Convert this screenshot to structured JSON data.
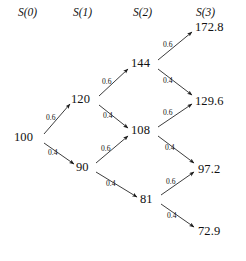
{
  "diagram": {
    "headers": [
      {
        "label": "S(0)",
        "x": 18,
        "y": 6
      },
      {
        "label": "S(1)",
        "x": 73,
        "y": 6
      },
      {
        "label": "S(2)",
        "x": 133,
        "y": 6
      },
      {
        "label": "S(3)",
        "x": 196,
        "y": 6
      }
    ],
    "nodes": [
      {
        "id": "n0",
        "label": "100",
        "x": 14,
        "y": 130,
        "step": 0
      },
      {
        "id": "n1u",
        "label": "120",
        "x": 71,
        "y": 92,
        "step": 1
      },
      {
        "id": "n1d",
        "label": "90",
        "x": 76,
        "y": 160,
        "step": 1
      },
      {
        "id": "n2uu",
        "label": "144",
        "x": 131,
        "y": 56,
        "step": 2
      },
      {
        "id": "n2ud",
        "label": "108",
        "x": 131,
        "y": 123,
        "step": 2
      },
      {
        "id": "n2dd",
        "label": "81",
        "x": 140,
        "y": 192,
        "step": 2
      },
      {
        "id": "n3a",
        "label": "172.8",
        "x": 195,
        "y": 20,
        "step": 3
      },
      {
        "id": "n3b",
        "label": "129.6",
        "x": 195,
        "y": 94,
        "step": 3
      },
      {
        "id": "n3c",
        "label": "97.2",
        "x": 198,
        "y": 162,
        "step": 3
      },
      {
        "id": "n3d",
        "label": "72.9",
        "x": 198,
        "y": 224,
        "step": 3
      }
    ],
    "edges": [
      {
        "from": "n0",
        "to": "n1u",
        "prob": "0.6",
        "direction": "up",
        "x1": 44,
        "y1": 134,
        "x2": 70,
        "y2": 104,
        "lx": 46,
        "ly": 113
      },
      {
        "from": "n0",
        "to": "n1d",
        "prob": "0.4",
        "direction": "down",
        "x1": 44,
        "y1": 143,
        "x2": 74,
        "y2": 164,
        "lx": 48,
        "ly": 148
      },
      {
        "from": "n1u",
        "to": "n2uu",
        "prob": "0.6",
        "direction": "up",
        "x1": 99,
        "y1": 96,
        "x2": 128,
        "y2": 69,
        "lx": 102,
        "ly": 77
      },
      {
        "from": "n1u",
        "to": "n2ud",
        "prob": "0.4",
        "direction": "down",
        "x1": 99,
        "y1": 105,
        "x2": 128,
        "y2": 128,
        "lx": 103,
        "ly": 111
      },
      {
        "from": "n1d",
        "to": "n2ud",
        "prob": "0.6",
        "direction": "up",
        "x1": 96,
        "y1": 163,
        "x2": 128,
        "y2": 136,
        "lx": 101,
        "ly": 144
      },
      {
        "from": "n1d",
        "to": "n2dd",
        "prob": "0.4",
        "direction": "down",
        "x1": 96,
        "y1": 172,
        "x2": 137,
        "y2": 197,
        "lx": 106,
        "ly": 179
      },
      {
        "from": "n2uu",
        "to": "n3a",
        "prob": "0.6",
        "direction": "up",
        "x1": 158,
        "y1": 60,
        "x2": 192,
        "y2": 32,
        "lx": 163,
        "ly": 40
      },
      {
        "from": "n2uu",
        "to": "n3b",
        "prob": "0.4",
        "direction": "down",
        "x1": 158,
        "y1": 69,
        "x2": 192,
        "y2": 95,
        "lx": 163,
        "ly": 76
      },
      {
        "from": "n2ud",
        "to": "n3b",
        "prob": "0.6",
        "direction": "up",
        "x1": 158,
        "y1": 127,
        "x2": 192,
        "y2": 104,
        "lx": 163,
        "ly": 108
      },
      {
        "from": "n2ud",
        "to": "n3c",
        "prob": "0.4",
        "direction": "down",
        "x1": 158,
        "y1": 136,
        "x2": 194,
        "y2": 163,
        "lx": 165,
        "ly": 143
      },
      {
        "from": "n2dd",
        "to": "n3c",
        "prob": "0.6",
        "direction": "up",
        "x1": 161,
        "y1": 195,
        "x2": 194,
        "y2": 172,
        "lx": 166,
        "ly": 177
      },
      {
        "from": "n2dd",
        "to": "n3d",
        "prob": "0.4",
        "direction": "down",
        "x1": 161,
        "y1": 204,
        "x2": 194,
        "y2": 227,
        "lx": 167,
        "ly": 211
      }
    ],
    "colors": {
      "background": "#ffffff",
      "ink": "#1a1a1a",
      "edge": "#1a1a1a"
    }
  }
}
